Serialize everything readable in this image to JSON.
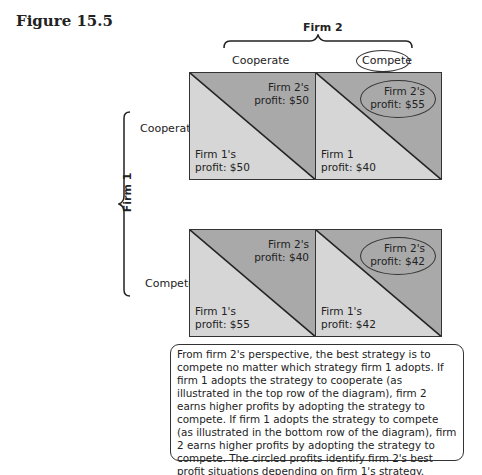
{
  "figure": {
    "title": "Figure 15.5"
  },
  "firm2": {
    "label": "Firm 2",
    "columns": [
      "Cooperate",
      "Compete"
    ],
    "circled_column": "Compete"
  },
  "firm1": {
    "label": "Firm 1",
    "rows": [
      "Cooperate",
      "Compete"
    ]
  },
  "cells": [
    {
      "firm2": "Firm 2's\nprofit: $50",
      "firm1": "Firm 1's\nprofit: $50",
      "f2l1": "Firm 2's",
      "f2l2": "profit: $50",
      "f1l1": "Firm 1's",
      "f1l2": "profit: $50",
      "circled": false
    },
    {
      "firm2": "Firm 2's\nprofit: $55",
      "firm1": "Firm 1\nprofit: $40",
      "f2l1": "Firm 2's",
      "f2l2": "profit: $55",
      "f1l1": "Firm 1",
      "f1l2": "profit: $40",
      "circled": true
    },
    {
      "firm2": "Firm 2's\nprofit: $40",
      "firm1": "Firm 1's\nprofit: $55",
      "f2l1": "Firm 2's",
      "f2l2": "profit: $40",
      "f1l1": "Firm 1's",
      "f1l2": "profit: $55",
      "circled": false
    },
    {
      "firm2": "Firm 2's\nprofit: $42",
      "firm1": "Firm 1's\nprofit: $42",
      "f2l1": "Firm 2's",
      "f2l2": "profit: $42",
      "f1l1": "Firm 1's",
      "f1l2": "profit: $42",
      "circled": true
    }
  ],
  "colors": {
    "upper_triangle": "#a9a9a9",
    "lower_triangle": "#d6d6d6",
    "border": "#333333"
  },
  "note": "From firm 2's perspective, the best strategy is to compete no matter which strategy firm 1 adopts. If firm 1 adopts the strategy to cooperate (as illustrated in the top row of the diagram), firm 2 earns higher profits by adopting the strategy to compete. If firm 1 adopts the strategy to compete (as illustrated in the bottom row of the diagram), firm 2 earns higher profits by adopting the strategy to compete. The circled profits identify firm 2's best profit situations depending on firm 1's strategy."
}
